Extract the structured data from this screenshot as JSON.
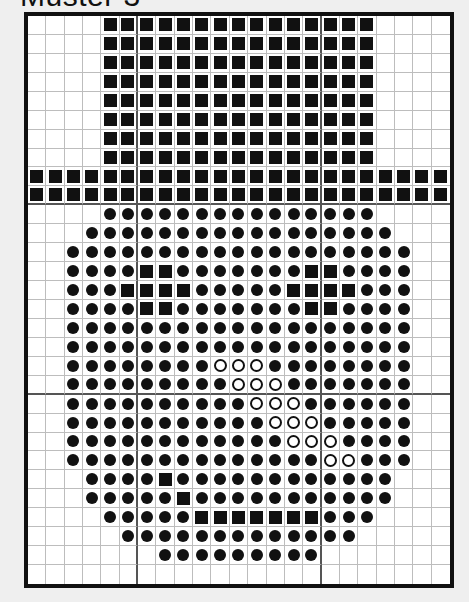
{
  "title": "Muster 3",
  "grid": {
    "columns": 23,
    "rows": 30,
    "major_divider_every": 10,
    "major_column_dividers_after": [
      6,
      16
    ],
    "major_row_dividers_after": [
      10,
      20
    ],
    "legend": {
      "S": "filled-square",
      "D": "filled-dot",
      "O": "open-circle",
      ".": "empty"
    },
    "colors": {
      "symbol": "#111111",
      "minor_line": "#bdbdbd",
      "major_line": "#555555",
      "border": "#111111",
      "cell_background": "#ffffff",
      "page_background": "#efefef"
    },
    "pattern": [
      "....SSSSSSSSSSSSSSS....",
      "....SSSSSSSSSSSSSSS....",
      "....SSSSSSSSSSSSSSS....",
      "....SSSSSSSSSSSSSSS....",
      "....SSSSSSSSSSSSSSS....",
      "....SSSSSSSSSSSSSSS....",
      "....SSSSSSSSSSSSSSS....",
      "....SSSSSSSSSSSSSSS....",
      "SSSSSSSSSSSSSSSSSSSSSSS",
      "SSSSSSSSSSSSSSSSSSSSSSS",
      "....DDDDDDDDDDDDDDD....",
      "...DDDDDDDDDDDDDDDDD...",
      "..DDDDDDDDDDDDDDDDDDD..",
      "..DDDDSSDDDDDDDSSDDDD..",
      "..DDDSSSSDDDDDSSSSDDD..",
      "..DDDDSSDDDDDDDSSDDDD..",
      "..DDDDDDDDDDDDDDDDDDD..",
      "..DDDDDDDDDDDDDDDDDDD..",
      "..DDDDDDDDOOODDDDDDDD..",
      "..DDDDDDDDDOOODDDDDDD..",
      "..DDDDDDDDDDOOODDDDDD..",
      "..DDDDDDDDDDDOOODDDDD..",
      "..DDDDDDDDDDDDOOODDDD..",
      "..DDDDDDDDDDDDDDOODDD..",
      "...DDDDSDDDDDDDDDDDD...",
      "...DDDDDSDDDDDDDDDDD...",
      "....DDDDDSSSSSSSDDD....",
      ".....DDDDDDDDDDDDD.....",
      ".......DDDDDDDDD.......",
      "......................."
    ]
  }
}
